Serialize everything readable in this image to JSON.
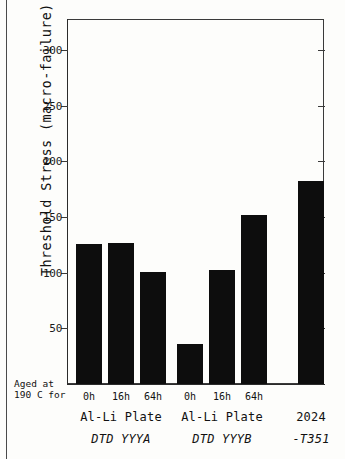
{
  "chart_data": {
    "type": "bar",
    "title": "",
    "xlabel": "",
    "ylabel": "Threshold Stress (macro-failure)  --MPa--",
    "ylim": [
      0,
      327
    ],
    "yticks": [
      50,
      100,
      150,
      200,
      250,
      300
    ],
    "ytick_labels": [
      "50",
      "100",
      "150",
      "200",
      "250",
      "300"
    ],
    "grid": false,
    "legend": "none",
    "categories": [
      "0h",
      "16h",
      "64h",
      "0h",
      "16h",
      "64h",
      ""
    ],
    "values": [
      126,
      127,
      101,
      36,
      102,
      152,
      182
    ],
    "bar_color": "#0d0d0d",
    "groups": [
      {
        "name": "Al-Li Plate",
        "sub": "DTD YYYA",
        "categories": [
          "0h",
          "16h",
          "64h"
        ],
        "values": [
          126,
          127,
          101
        ]
      },
      {
        "name": "Al-Li Plate",
        "sub": "DTD YYYB",
        "categories": [
          "0h",
          "16h",
          "64h"
        ],
        "values": [
          36,
          102,
          152
        ]
      },
      {
        "name": "2024",
        "sub": "-T351",
        "categories": [
          ""
        ],
        "values": [
          182
        ]
      }
    ],
    "annotations": [
      "Aged at",
      "190 C for"
    ]
  },
  "axis": {
    "y_title": "Threshold Stress (macro-failure)  --MPa--",
    "ticks": [
      {
        "label": "300",
        "value": 300
      },
      {
        "label": "250",
        "value": 250
      },
      {
        "label": "200",
        "value": 200
      },
      {
        "label": "150",
        "value": 150
      },
      {
        "label": "100",
        "value": 100
      },
      {
        "label": "50",
        "value": 50
      }
    ]
  },
  "notes": {
    "line1": "Aged at",
    "line2": "190 C for"
  },
  "bars": [
    {
      "label": "0h",
      "value": 126,
      "group": 0
    },
    {
      "label": "16h",
      "value": 127,
      "group": 0
    },
    {
      "label": "64h",
      "value": 101,
      "group": 0
    },
    {
      "label": "0h",
      "value": 36,
      "group": 1
    },
    {
      "label": "16h",
      "value": 102,
      "group": 1
    },
    {
      "label": "64h",
      "value": 152,
      "group": 1
    },
    {
      "label": "",
      "value": 182,
      "group": 2
    }
  ],
  "groups": [
    {
      "name": "Al-Li Plate",
      "sub": "DTD YYYA"
    },
    {
      "name": "Al-Li Plate",
      "sub": "DTD YYYB"
    },
    {
      "name": "2024",
      "sub": "-T351"
    }
  ]
}
